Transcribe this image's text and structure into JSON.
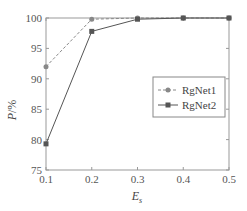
{
  "chart_data": {
    "type": "line",
    "title": "",
    "xlabel": "E_s",
    "ylabel": "P/%",
    "x": [
      0.1,
      0.2,
      0.3,
      0.4,
      0.5
    ],
    "xticks": [
      "0.1",
      "0.2",
      "0.3",
      "0.4",
      "0.5"
    ],
    "yticks": [
      "75",
      "80",
      "85",
      "90",
      "95",
      "100"
    ],
    "xlim": [
      0.1,
      0.5
    ],
    "ylim": [
      75,
      100
    ],
    "grid": false,
    "legend_position": "right-center",
    "series": [
      {
        "name": "RgNet1",
        "values": [
          92.0,
          99.8,
          100.0,
          100.0,
          100.0
        ],
        "style": "dashed",
        "marker": "circle",
        "color": "#888888"
      },
      {
        "name": "RgNet2",
        "values": [
          79.3,
          97.8,
          99.8,
          100.0,
          100.0
        ],
        "style": "solid",
        "marker": "square",
        "color": "#555555"
      }
    ]
  }
}
